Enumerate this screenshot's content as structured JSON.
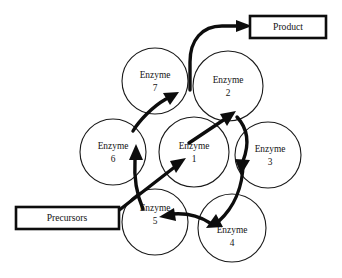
{
  "diagram": {
    "background_color": "#ffffff",
    "stroke_color": "#0d0d0d",
    "circle_stroke_color": "#1a1a1a",
    "text_color": "#141414",
    "nodes": [
      {
        "id": "enzyme-7",
        "label": "Enzyme",
        "number": "7",
        "cx": 155,
        "cy": 81,
        "r": 33
      },
      {
        "id": "enzyme-2",
        "label": "Enzyme",
        "number": "2",
        "cx": 228,
        "cy": 86,
        "r": 35
      },
      {
        "id": "enzyme-6",
        "label": "Enzyme",
        "number": "6",
        "cx": 113,
        "cy": 152,
        "r": 33
      },
      {
        "id": "enzyme-1",
        "label": "Enzyme",
        "number": "1",
        "cx": 194,
        "cy": 152,
        "r": 35
      },
      {
        "id": "enzyme-3",
        "label": "Enzyme",
        "number": "3",
        "cx": 268,
        "cy": 155,
        "r": 33
      },
      {
        "id": "enzyme-5",
        "label": "Enzyme",
        "number": "5",
        "cx": 155,
        "cy": 222,
        "r": 33
      },
      {
        "id": "enzyme-4",
        "label": "Enzyme",
        "number": "4",
        "cx": 232,
        "cy": 228,
        "r": 34
      }
    ],
    "boxes": [
      {
        "id": "product-box",
        "label": "Product",
        "x": 250,
        "y": 16,
        "w": 76,
        "h": 22
      },
      {
        "id": "precursors-box",
        "label": "Precursors",
        "x": 16,
        "y": 207,
        "w": 103,
        "h": 22
      }
    ],
    "flows": [
      {
        "id": "precursors-to-enzyme-1",
        "from": "Precursors",
        "to": "Enzyme 1"
      },
      {
        "id": "enzyme-1-to-enzyme-2",
        "from": "Enzyme 1",
        "to": "Enzyme 2"
      },
      {
        "id": "enzyme-2-to-enzyme-3",
        "from": "Enzyme 2",
        "to": "Enzyme 3"
      },
      {
        "id": "enzyme-3-to-enzyme-4",
        "from": "Enzyme 3",
        "to": "Enzyme 4"
      },
      {
        "id": "enzyme-4-to-enzyme-5",
        "from": "Enzyme 4",
        "to": "Enzyme 5"
      },
      {
        "id": "enzyme-5-to-enzyme-6",
        "from": "Enzyme 5",
        "to": "Enzyme 6"
      },
      {
        "id": "enzyme-6-to-enzyme-7",
        "from": "Enzyme 6",
        "to": "Enzyme 7"
      },
      {
        "id": "enzyme-7-to-product",
        "from": "Enzyme 7",
        "to": "Product"
      }
    ]
  }
}
